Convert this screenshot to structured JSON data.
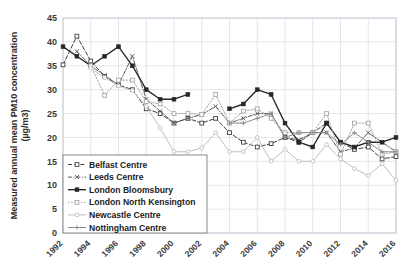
{
  "chart_data": {
    "type": "line",
    "title": "",
    "xlabel": "",
    "ylabel": "Measured annual mean PM10 concentration (µg/m3)",
    "ylim": [
      0,
      45
    ],
    "ytick_step": 5,
    "yticks": [
      "0",
      "5",
      "10",
      "15",
      "20",
      "25",
      "30",
      "35",
      "40",
      "45"
    ],
    "xlim": [
      1992,
      2016
    ],
    "xticks": [
      "1992",
      "1994",
      "1996",
      "1998",
      "2000",
      "2002",
      "2004",
      "2006",
      "2008",
      "2010",
      "2012",
      "2014",
      "2016"
    ],
    "x": [
      1992,
      1993,
      1994,
      1995,
      1996,
      1997,
      1998,
      1999,
      2000,
      2001,
      2002,
      2003,
      2004,
      2005,
      2006,
      2007,
      2008,
      2009,
      2010,
      2011,
      2012,
      2013,
      2014,
      2015,
      2016
    ],
    "grid": true,
    "legend_position": "inside-lower-left",
    "series": [
      {
        "name": "Belfast Centre",
        "color": "#404040",
        "style": "dashed",
        "marker": "square-open",
        "values": [
          35.2,
          41.2,
          36.0,
          32.8,
          31.0,
          30.0,
          26.0,
          25.0,
          23.0,
          24.0,
          23.0,
          24.0,
          21.0,
          19.0,
          18.0,
          18.7,
          20.0,
          19.0,
          21.0,
          23.0,
          19.0,
          17.5,
          18.0,
          15.5,
          16.0
        ]
      },
      {
        "name": "Leeds Centre",
        "color": "#595959",
        "style": "dash-dot",
        "marker": "x-cross",
        "values": [
          null,
          38.0,
          35.0,
          33.0,
          31.0,
          37.0,
          28.0,
          25.5,
          23.0,
          24.0,
          24.8,
          26.5,
          23.0,
          24.0,
          25.0,
          25.0,
          20.0,
          19.5,
          21.0,
          21.0,
          17.0,
          17.8,
          21.0,
          19.0,
          17.0
        ]
      },
      {
        "name": "London Bloomsbury",
        "color": "#262626",
        "style": "solid",
        "marker": "square-filled",
        "values": [
          39.0,
          37.0,
          35.0,
          37.0,
          39.0,
          35.0,
          30.0,
          28.0,
          28.0,
          29.0,
          null,
          null,
          26.0,
          27.0,
          30.0,
          29.0,
          23.0,
          19.0,
          18.0,
          23.0,
          19.0,
          18.0,
          19.0,
          19.0,
          20.0
        ]
      },
      {
        "name": "London North Kensington",
        "color": "#a6a6a6",
        "style": "dotted",
        "marker": "square-open-light",
        "values": [
          null,
          null,
          35.0,
          28.8,
          32.0,
          32.0,
          27.5,
          27.0,
          25.0,
          25.0,
          24.8,
          29.0,
          23.0,
          25.5,
          26.0,
          24.0,
          21.0,
          21.0,
          21.0,
          25.0,
          16.5,
          23.0,
          23.0,
          16.5,
          17.0
        ]
      },
      {
        "name": "Newcastle Centre",
        "color": "#bfbfbf",
        "style": "solid-light",
        "marker": "circle-open",
        "values": [
          null,
          null,
          34.5,
          32.5,
          30.8,
          29.8,
          26.5,
          22.0,
          17.0,
          17.0,
          17.8,
          21.0,
          17.0,
          17.0,
          20.0,
          15.0,
          17.5,
          15.0,
          15.0,
          18.5,
          15.5,
          13.5,
          12.0,
          14.5,
          11.0
        ]
      },
      {
        "name": "Nottingham Centre",
        "color": "#8c8c8c",
        "style": "solid-mid",
        "marker": "plus-cross",
        "values": [
          null,
          null,
          null,
          null,
          null,
          null,
          null,
          null,
          null,
          null,
          null,
          null,
          23.0,
          23.0,
          24.0,
          25.0,
          20.0,
          21.0,
          21.0,
          21.0,
          18.5,
          21.0,
          19.0,
          17.0,
          17.0
        ]
      }
    ]
  },
  "axis": {
    "y_title": "Measured annual mean PM10 concentration (µg/m3)"
  },
  "legend": {
    "items": [
      {
        "label": "Belfast Centre"
      },
      {
        "label": "Leeds Centre"
      },
      {
        "label": "London Bloomsbury"
      },
      {
        "label": "London North Kensington"
      },
      {
        "label": "Newcastle Centre"
      },
      {
        "label": "Nottingham Centre"
      }
    ]
  }
}
